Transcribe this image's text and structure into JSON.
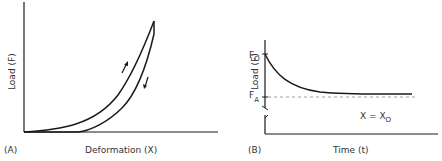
{
  "panels": [
    {
      "id": "A",
      "tag": "(A)",
      "xlabel": "Deformation (X)",
      "ylabel": "Load (F)",
      "description": "Hysteresis loop: loading curve (upper, arrow up) and unloading curve (lower, arrow down)"
    },
    {
      "id": "B",
      "tag": "(B)",
      "xlabel": "Time (t)",
      "ylabel": "Load (F)",
      "y_marks": {
        "top": "F",
        "top_sub": "O",
        "bottom": "F",
        "bottom_sub": "A"
      },
      "condition": "X = X",
      "condition_sub": "O",
      "description": "Stress relaxation: load decays from F0 toward FA at constant deformation X0"
    }
  ],
  "colors": {
    "line": "#1a1a1a",
    "text": "#333333",
    "dash": "#888888"
  }
}
